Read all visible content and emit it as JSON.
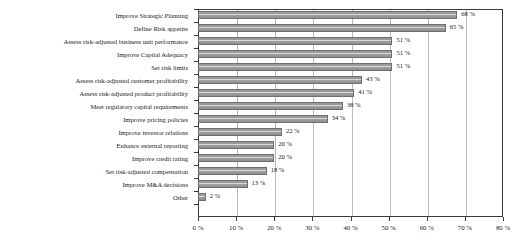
{
  "chart_data": {
    "type": "bar",
    "orientation": "horizontal",
    "title": "",
    "xlabel": "",
    "ylabel": "",
    "xlim": [
      0,
      80
    ],
    "xtick_labels": [
      "0 %",
      "10 %",
      "20 %",
      "30 %",
      "40 %",
      "50 %",
      "60 %",
      "70 %",
      "80 %"
    ],
    "xtick_values": [
      0,
      10,
      20,
      30,
      40,
      50,
      60,
      70,
      80
    ],
    "grid": "vertical",
    "legend": "none",
    "value_suffix": " %",
    "categories": [
      "Improve Strategic Planning",
      "Define Risk appetite",
      "Assess risk-adjusted business unit performance",
      "Improve Capital Adequacy",
      "Set risk limits",
      "Assess risk-adjusted customer profitability",
      "Assess risk-adjusted product profitability",
      "Meet regulatory capital requirements",
      "Improve pricing policies",
      "Improve investor relations",
      "Enhance external reporting",
      "Improve credit rating",
      "Set risk-adjusted compensation",
      "Improve M&A decisions",
      "Other"
    ],
    "values": [
      68,
      65,
      51,
      51,
      51,
      43,
      41,
      38,
      34,
      22,
      20,
      20,
      18,
      13,
      2
    ],
    "data_labels": [
      "68 %",
      "65 %",
      "51 %",
      "51 %",
      "51 %",
      "43 %",
      "41 %",
      "38 %",
      "34 %",
      "22 %",
      "20 %",
      "20 %",
      "18 %",
      "13 %",
      "2 %"
    ],
    "colors": {
      "bar_fill": "#9a9a9a",
      "bar_highlight": "#d8d8d8",
      "bar_border": "#6e6e6e",
      "gridline": "#b9b9b9",
      "axis": "#3a3a3a",
      "text": "#1a1a1a",
      "background": "#ffffff"
    }
  }
}
